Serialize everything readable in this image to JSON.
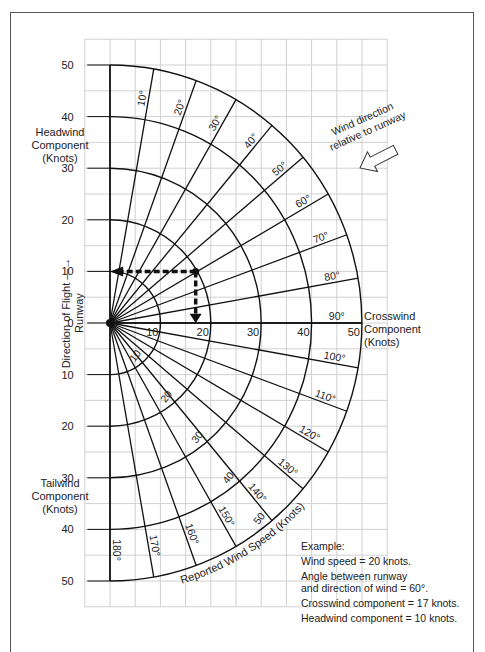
{
  "chart_data": {
    "type": "polar-nomogram",
    "xlabel": "Crosswind Component (Knots)",
    "ylabel_top": "Headwind Component (Knots)",
    "ylabel_bottom": "Tailwind Component (Knots)",
    "runway_label": "Direction of Flight Runway",
    "radial_label": "Reported Wind Speed (Knots)",
    "wind_arrow_label": "Wind direction relative to runway",
    "x_ticks": [
      10,
      20,
      30,
      40,
      50
    ],
    "y_ticks_upper": [
      50,
      40,
      30,
      20,
      10,
      0
    ],
    "y_ticks_lower": [
      10,
      20,
      30,
      40,
      50
    ],
    "xlim": [
      -5,
      55
    ],
    "ylim": [
      -55,
      55
    ],
    "grid": true,
    "grid_step_knots": 5,
    "speed_arcs": [
      10,
      20,
      30,
      40,
      50
    ],
    "speed_arc_labels": [
      "10",
      "20",
      "30",
      "40",
      "50"
    ],
    "angles_deg": [
      0,
      10,
      20,
      30,
      40,
      50,
      60,
      70,
      80,
      90,
      100,
      110,
      120,
      130,
      140,
      150,
      160,
      170,
      180
    ],
    "angle_labels": [
      "10°",
      "20°",
      "30°",
      "40°",
      "50°",
      "60°",
      "70°",
      "80°",
      "90°",
      "100°",
      "110°",
      "120°",
      "130°",
      "140°",
      "150°",
      "160°",
      "170°",
      "180°"
    ],
    "example": {
      "wind_speed": 20,
      "angle": 60,
      "crosswind": 17,
      "headwind": 10
    }
  },
  "labels": {
    "headwind": "Headwind\nComponent\n(Knots)",
    "tailwind": "Tailwind\nComponent\n(Knots)",
    "crosswind": "Crosswind\nComponent\n(Knots)",
    "runway_line1": "Direction of Flight —→",
    "runway_line2": "Runway",
    "wind_dir_line1": "Wind direction",
    "wind_dir_line2": "relative to runway",
    "reported_speed": "Reported Wind Speed (Knots)"
  },
  "example_text": {
    "title": "Example:",
    "line1": "Wind speed = 20 knots.",
    "line2a": "Angle between runway",
    "line2b": "and direction of wind = 60°.",
    "line3": "Crosswind component = 17 knots.",
    "line4": "Headwind component = 10 knots."
  },
  "colors": {
    "grid": "#d0d0d0",
    "lines": "#111111",
    "text": "#222222",
    "frame": "#555555"
  }
}
